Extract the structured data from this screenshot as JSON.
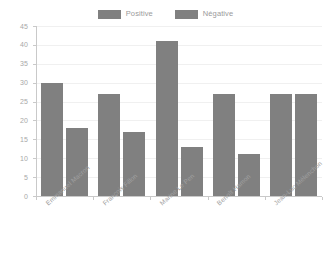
{
  "chart_data": {
    "type": "bar",
    "title": "",
    "subtitle": "",
    "xlabel": "",
    "ylabel": "",
    "categories": [
      "Emmanuel Macron",
      "François Fillon",
      "Marine Le Pen",
      "Benoît Hamon",
      "Jean-Luc Mélenchon"
    ],
    "series": [
      {
        "name": "Positive",
        "values": [
          30,
          27,
          41,
          27,
          27
        ],
        "color": "#808080"
      },
      {
        "name": "Négative",
        "values": [
          18,
          17,
          13,
          11,
          27
        ],
        "color": "#808080"
      }
    ],
    "ylim": [
      0,
      45
    ],
    "ytick_step": 5,
    "yticks": [
      "45",
      "40",
      "35",
      "30",
      "25",
      "20",
      "15",
      "10",
      "5",
      "0"
    ],
    "grid": true,
    "grid_color": "#f0f0f0",
    "legend_position": "top-center",
    "axis_color": "#c9c9c9",
    "tick_label_color": "#a8a8a8",
    "background": "#ffffff"
  },
  "legend": {
    "items": [
      {
        "label": "Positive",
        "color": "#808080"
      },
      {
        "label": "Négative",
        "color": "#808080"
      }
    ]
  }
}
